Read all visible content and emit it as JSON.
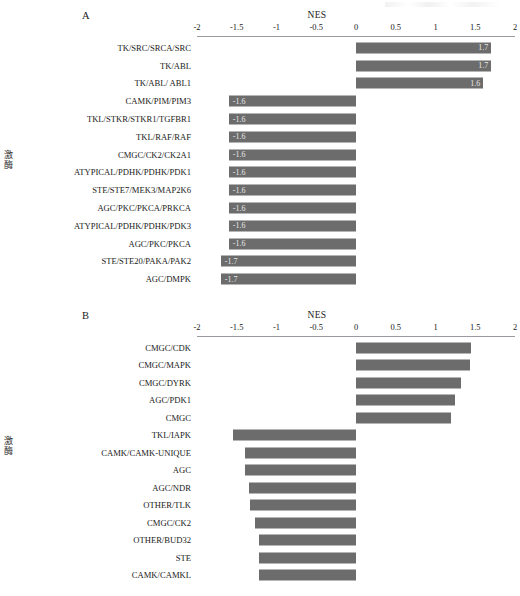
{
  "figure": {
    "background": "#ffffff",
    "bar_color": "#6c6c6c",
    "axis_color": "#9a9aa0"
  },
  "panels": {
    "a": {
      "letter": "A",
      "axis_title": "NES",
      "y_axis_label": "激酶"
    },
    "b": {
      "letter": "B",
      "axis_title": "NES",
      "y_axis_label": "激酶"
    }
  },
  "chart_data": [
    {
      "type": "bar",
      "panel": "A",
      "orientation": "horizontal",
      "title": "A",
      "xlabel": "NES",
      "ylabel": "激酶",
      "xlim": [
        -2,
        2
      ],
      "xticks": [
        -2,
        -1.5,
        -1,
        -0.5,
        0,
        0.5,
        1,
        1.5,
        2
      ],
      "xticklabels": [
        "-2",
        "-1.5",
        "-1",
        "-0.5",
        "0",
        "0.5",
        "1",
        "1.5",
        "2"
      ],
      "grid": false,
      "legend": false,
      "show_value_labels": true,
      "categories": [
        "TK/SRC/SRCA/SRC",
        "TK/ABL",
        "TK/ABL/ ABL1",
        "CAMK/PIM/PIM3",
        "TKL/STKR/STKR1/TGFBR1",
        "TKL/RAF/RAF",
        "CMGC/CK2/CK2A1",
        "ATYPICAL/PDHK/PDHK/PDK1",
        "STE/STE7/MEK3/MAP2K6",
        "AGC/PKC/PKCA/PRKCA",
        "ATYPICAL/PDHK/PDHK/PDK3",
        "AGC/PKC/PKCA",
        "STE/STE20/PAKA/PAK2",
        "AGC/DMPK"
      ],
      "values": [
        1.7,
        1.7,
        1.6,
        -1.6,
        -1.6,
        -1.6,
        -1.6,
        -1.6,
        -1.6,
        -1.6,
        -1.6,
        -1.6,
        -1.7,
        -1.7
      ],
      "value_labels": [
        "1.7",
        "1.7",
        "1.6",
        "-1.6",
        "-1.6",
        "-1.6",
        "-1.6",
        "-1.6",
        "-1.6",
        "-1.6",
        "-1.6",
        "-1.6",
        "-1.7",
        "-1.7"
      ]
    },
    {
      "type": "bar",
      "panel": "B",
      "orientation": "horizontal",
      "title": "B",
      "xlabel": "NES",
      "ylabel": "激酶",
      "xlim": [
        -2,
        2
      ],
      "xticks": [
        -2,
        -1.5,
        -1,
        -0.5,
        0,
        0.5,
        1,
        1.5,
        2
      ],
      "xticklabels": [
        "-2",
        "-1.5",
        "-1",
        "-0.5",
        "0",
        "0.5",
        "1",
        "1.5",
        "2"
      ],
      "grid": false,
      "legend": false,
      "show_value_labels": false,
      "categories": [
        "CMGC/CDK",
        "CMGC/MAPK",
        "CMGC/DYRK",
        "AGC/PDK1",
        "CMGC",
        "TKL/IAPK",
        "CAMK/CAMK-UNIQUE",
        "AGC",
        "AGC/NDR",
        "OTHER/TLK",
        "CMGC/CK2",
        "OTHER/BUD32",
        "STE",
        "CAMK/CAMKL"
      ],
      "values": [
        1.45,
        1.43,
        1.32,
        1.25,
        1.2,
        -1.55,
        -1.4,
        -1.4,
        -1.34,
        -1.33,
        -1.27,
        -1.22,
        -1.22,
        -1.22
      ]
    }
  ]
}
